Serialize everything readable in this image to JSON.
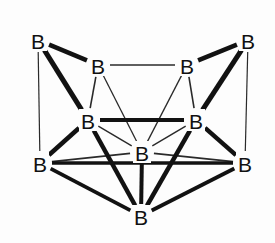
{
  "figure": {
    "caption": "",
    "background_color": "#fdfdfd",
    "bond_color_thick": "#121212",
    "bond_color_thin": "#2a2a2a",
    "label_color": "#111111",
    "element_symbol": "B"
  },
  "chart_data": {
    "type": "diagram",
    "vertex_label": "B",
    "vertex_count": 10,
    "bond_count": 24,
    "vertices": [
      {
        "id": "b-top-left",
        "label": "B",
        "x": 38,
        "y": 40
      },
      {
        "id": "b-top-right",
        "label": "B",
        "x": 248,
        "y": 40
      },
      {
        "id": "b-upper-left",
        "label": "B",
        "x": 98,
        "y": 65
      },
      {
        "id": "b-upper-right",
        "label": "B",
        "x": 187,
        "y": 65
      },
      {
        "id": "b-mid-left",
        "label": "B",
        "x": 88,
        "y": 120
      },
      {
        "id": "b-mid-right",
        "label": "B",
        "x": 196,
        "y": 120
      },
      {
        "id": "b-lower-left",
        "label": "B",
        "x": 40,
        "y": 163
      },
      {
        "id": "b-lower-right",
        "label": "B",
        "x": 245,
        "y": 163
      },
      {
        "id": "b-center",
        "label": "B",
        "x": 142,
        "y": 152
      },
      {
        "id": "b-bottom",
        "label": "B",
        "x": 141,
        "y": 216
      }
    ],
    "bonds": [
      {
        "from": "b-top-left",
        "to": "b-upper-left",
        "weight": "thick",
        "width": 4.5
      },
      {
        "from": "b-top-left",
        "to": "b-mid-left",
        "weight": "thick",
        "width": 5.0
      },
      {
        "from": "b-top-left",
        "to": "b-lower-left",
        "weight": "thin",
        "width": 1.2
      },
      {
        "from": "b-top-right",
        "to": "b-upper-right",
        "weight": "thick",
        "width": 4.5
      },
      {
        "from": "b-top-right",
        "to": "b-mid-right",
        "weight": "thick",
        "width": 5.0
      },
      {
        "from": "b-top-right",
        "to": "b-lower-right",
        "weight": "thin",
        "width": 1.2
      },
      {
        "from": "b-upper-left",
        "to": "b-upper-right",
        "weight": "thin",
        "width": 1.6
      },
      {
        "from": "b-upper-left",
        "to": "b-mid-left",
        "weight": "thin",
        "width": 1.6
      },
      {
        "from": "b-upper-left",
        "to": "b-center",
        "weight": "thin",
        "width": 1.3
      },
      {
        "from": "b-upper-right",
        "to": "b-mid-right",
        "weight": "thin",
        "width": 1.6
      },
      {
        "from": "b-upper-right",
        "to": "b-center",
        "weight": "thin",
        "width": 1.3
      },
      {
        "from": "b-mid-left",
        "to": "b-mid-right",
        "weight": "thick",
        "width": 4.2
      },
      {
        "from": "b-mid-left",
        "to": "b-lower-left",
        "weight": "thick",
        "width": 4.5
      },
      {
        "from": "b-mid-left",
        "to": "b-center",
        "weight": "thin",
        "width": 1.4
      },
      {
        "from": "b-mid-left",
        "to": "b-bottom",
        "weight": "thick",
        "width": 4.5
      },
      {
        "from": "b-mid-right",
        "to": "b-lower-right",
        "weight": "thick",
        "width": 4.5
      },
      {
        "from": "b-mid-right",
        "to": "b-center",
        "weight": "thin",
        "width": 1.4
      },
      {
        "from": "b-mid-right",
        "to": "b-bottom",
        "weight": "thick",
        "width": 4.5
      },
      {
        "from": "b-lower-left",
        "to": "b-center",
        "weight": "thin",
        "width": 1.8
      },
      {
        "from": "b-lower-left",
        "to": "b-bottom",
        "weight": "thick",
        "width": 3.8
      },
      {
        "from": "b-lower-left",
        "to": "b-lower-right",
        "weight": "thick",
        "width": 3.6
      },
      {
        "from": "b-lower-right",
        "to": "b-center",
        "weight": "thin",
        "width": 1.8
      },
      {
        "from": "b-lower-right",
        "to": "b-bottom",
        "weight": "thick",
        "width": 3.8
      },
      {
        "from": "b-center",
        "to": "b-bottom",
        "weight": "thick",
        "width": 4.0
      }
    ]
  }
}
